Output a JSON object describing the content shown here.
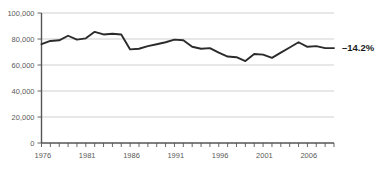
{
  "chart_data": {
    "type": "line",
    "title": "",
    "subtitle": "",
    "xlabel": "",
    "ylabel": "",
    "grid": true,
    "legend_position": "none",
    "xlim": [
      1976,
      2009
    ],
    "ylim": [
      0,
      100000
    ],
    "x_tick_labels": [
      "1976",
      "1981",
      "1986",
      "1991",
      "1996",
      "2001",
      "2006"
    ],
    "x_tick_values": [
      1976,
      1981,
      1986,
      1991,
      1996,
      2001,
      2006
    ],
    "x_minor_ticks_every": 1,
    "y_tick_labels": [
      "100,000",
      "80,000",
      "60,000",
      "40,000",
      "20,000",
      "0"
    ],
    "y_tick_values": [
      100000,
      80000,
      60000,
      40000,
      20000,
      0
    ],
    "annotations": [
      {
        "name": "end-value-change",
        "text": "–14.2%",
        "at_x": 2009,
        "at_y": 73000
      }
    ],
    "series": [
      {
        "name": "series-1",
        "color": "#2b2b2b",
        "x": [
          1976,
          1977,
          1978,
          1979,
          1980,
          1981,
          1982,
          1983,
          1984,
          1985,
          1986,
          1987,
          1988,
          1989,
          1990,
          1991,
          1992,
          1993,
          1994,
          1995,
          1996,
          1997,
          1998,
          1999,
          2000,
          2001,
          2002,
          2003,
          2004,
          2005,
          2006,
          2007,
          2008,
          2009
        ],
        "values": [
          76000,
          78500,
          79000,
          82500,
          79500,
          80500,
          85500,
          83500,
          84000,
          83500,
          72000,
          72500,
          74500,
          76000,
          77500,
          79500,
          79000,
          74000,
          72500,
          73000,
          69500,
          66500,
          66000,
          63000,
          68500,
          68000,
          65500,
          69500,
          73500,
          77500,
          74000,
          74500,
          73000,
          73000
        ]
      }
    ]
  }
}
